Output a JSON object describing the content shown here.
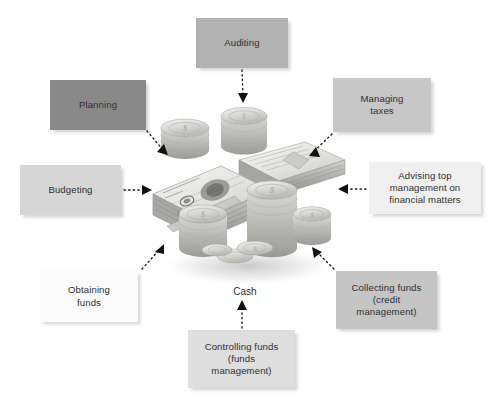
{
  "diagram": {
    "background_color": "#ffffff",
    "center": {
      "caption": "Cash",
      "artwork_name": "stacks-of-banknotes-and-coins",
      "artwork_description": "Grayscale photograph of bundled banknotes with stacks of coins"
    },
    "text_color": "#2f2f2f",
    "arrow_color": "#1a1a1a",
    "nodes": [
      {
        "id": "auditing",
        "label": "Auditing",
        "fill": "#b2b2b2",
        "arrow_direction": "down",
        "points_to_center": true
      },
      {
        "id": "planning",
        "label": "Planning",
        "fill": "#898989",
        "arrow_direction": "down-right",
        "points_to_center": true
      },
      {
        "id": "managing_taxes",
        "label": "Managing\ntaxes",
        "fill": "#c7c7c7",
        "arrow_direction": "down-left",
        "points_to_center": true
      },
      {
        "id": "budgeting",
        "label": "Budgeting",
        "fill": "#d6d6d6",
        "arrow_direction": "right",
        "points_to_center": true
      },
      {
        "id": "advising",
        "label": "Advising top\nmanagement on\nfinancial matters",
        "fill": "#f0f0f0",
        "arrow_direction": "left",
        "points_to_center": true
      },
      {
        "id": "obtaining_funds",
        "label": "Obtaining\nfunds",
        "fill": "#fbfbfb",
        "arrow_direction": "up-right",
        "points_to_center": true
      },
      {
        "id": "collecting_funds",
        "label": "Collecting funds\n(credit\nmanagement)",
        "fill": "#c5c5c5",
        "arrow_direction": "up-left",
        "points_to_center": true
      },
      {
        "id": "controlling_funds",
        "label": "Controlling funds\n(funds\nmanagement)",
        "fill": "#dedede",
        "arrow_direction": "up",
        "points_to_center": true
      }
    ]
  }
}
